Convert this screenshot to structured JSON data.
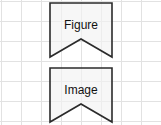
{
  "canvas": {
    "width": 161,
    "height": 125,
    "background_color": "#ffffff"
  },
  "grid": {
    "name": "background-grid",
    "line_color": "#e2e2e2",
    "cell_size_px": 20,
    "columns": 8,
    "rows": 6
  },
  "shapes": [
    {
      "id": "banner-figure",
      "type": "ribbon-banner",
      "label": "Figure",
      "fill_color": "#f2f2f2",
      "stroke_color": "#2b2b2b",
      "stroke_width": 1.6,
      "x": 50,
      "y": 3,
      "width": 62,
      "height": 54,
      "notch_depth": 18
    },
    {
      "id": "banner-image",
      "type": "ribbon-banner",
      "label": "Image",
      "fill_color": "#f2f2f2",
      "stroke_color": "#2b2b2b",
      "stroke_width": 1.6,
      "x": 50,
      "y": 68,
      "width": 62,
      "height": 54,
      "notch_depth": 18
    }
  ],
  "text": {
    "figure_label": "Figure",
    "image_label": "Image",
    "font_size_px": 12,
    "color": "#111111"
  }
}
